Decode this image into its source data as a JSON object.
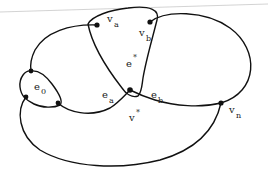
{
  "diagram": {
    "type": "graph-embedding",
    "colors": {
      "stroke": "#111111",
      "background": "#ffffff"
    },
    "vertices": [
      {
        "id": "va",
        "name": "v",
        "sub": "a",
        "x": 97,
        "y": 25
      },
      {
        "id": "vb",
        "name": "v",
        "sub": "b",
        "x": 150,
        "y": 22
      },
      {
        "id": "vstar",
        "name": "v",
        "sup": "*",
        "x": 130,
        "y": 90
      },
      {
        "id": "vn",
        "name": "v",
        "sub": "n",
        "x": 221,
        "y": 103
      },
      {
        "id": "p1",
        "x": 31,
        "y": 71
      },
      {
        "id": "p2",
        "x": 26,
        "y": 97
      },
      {
        "id": "p3",
        "x": 58,
        "y": 103
      }
    ],
    "labels": {
      "va": {
        "base": "v",
        "sub": "a"
      },
      "vb": {
        "base": "v",
        "sub": "b"
      },
      "estar": {
        "base": "e",
        "sup": "*"
      },
      "ea": {
        "base": "e",
        "sub": "a"
      },
      "eb": {
        "base": "e",
        "sub": "b"
      },
      "vstar": {
        "base": "v",
        "sup": "*"
      },
      "vn": {
        "base": "v",
        "sub": "n"
      },
      "e0": {
        "base": "e",
        "sub": "0"
      }
    }
  }
}
